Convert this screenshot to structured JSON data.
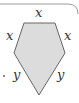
{
  "diagram": {
    "shape": "pentagon",
    "fill_color": "#dcdcdc",
    "stroke_color": "#666666",
    "border_color": "#9a9a9a",
    "labels": {
      "top": "x",
      "upper_left": "x",
      "upper_right": "x",
      "lower_left": "y",
      "lower_right": "y"
    },
    "marker": "."
  }
}
